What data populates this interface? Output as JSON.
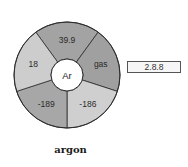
{
  "element": {
    "symbol": "Ar",
    "name": "argon",
    "electron_configuration": "2.8.8"
  },
  "segments": [
    {
      "key": "atomic_mass",
      "label": "39.9",
      "color": "#a3a3a3"
    },
    {
      "key": "state",
      "label": "gas",
      "color": "#a0a0a0"
    },
    {
      "key": "boiling_point",
      "label": "-186",
      "color": "#cfcfcf"
    },
    {
      "key": "melting_point",
      "label": "-189",
      "color": "#a7a7a7"
    },
    {
      "key": "atomic_number",
      "label": "18",
      "color": "#cdcdcd"
    }
  ],
  "colors": {
    "outline": "#2b2b2b",
    "center_fill": "#ffffff"
  }
}
